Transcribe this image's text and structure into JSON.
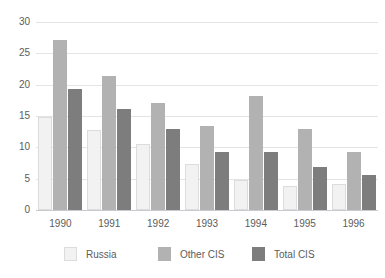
{
  "chart_data": {
    "type": "bar",
    "title": "",
    "title_remnant": "",
    "xlabel": "",
    "ylabel": "",
    "categories": [
      "1990",
      "1991",
      "1992",
      "1993",
      "1994",
      "1995",
      "1996"
    ],
    "series": [
      {
        "name": "Russia",
        "color": "#f2f2f2",
        "values": [
          14.8,
          12.7,
          10.6,
          7.4,
          4.8,
          3.9,
          4.1
        ]
      },
      {
        "name": "Other CIS",
        "color": "#b2b2b2",
        "values": [
          27.2,
          21.4,
          17.0,
          13.4,
          18.2,
          12.9,
          9.2
        ]
      },
      {
        "name": "Total CIS",
        "color": "#7d7d7d",
        "values": [
          19.3,
          16.1,
          13.0,
          9.3,
          9.3,
          6.8,
          5.6
        ]
      }
    ],
    "ylim": [
      0,
      30
    ],
    "yticks": [
      0,
      5,
      10,
      15,
      20,
      25,
      30
    ],
    "ytick_labels": [
      "0",
      "5",
      "10",
      "15",
      "20",
      "25",
      "30"
    ],
    "grid": "horizontal",
    "legend_position": "bottom"
  },
  "legend": {
    "entries": [
      {
        "label": "Russia"
      },
      {
        "label": "Other CIS"
      },
      {
        "label": "Total CIS"
      }
    ]
  },
  "colors": {
    "background": "#ffffff",
    "gridline": "#e3e3e8",
    "axis": "#c9c9cf",
    "text": "#5c5c5c"
  }
}
